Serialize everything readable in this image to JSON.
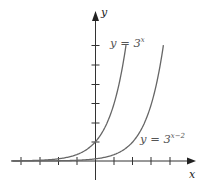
{
  "chart_data": {
    "type": "line",
    "title": "",
    "xlabel": "x",
    "ylabel": "y",
    "xlim": [
      -4,
      5
    ],
    "ylim": [
      -0.5,
      7
    ],
    "x_ticks": [
      -4,
      -3,
      -2,
      -1,
      1,
      2,
      3,
      4
    ],
    "y_ticks": [
      1,
      2,
      3,
      4,
      5,
      6
    ],
    "tick_labels_shown": false,
    "grid": false,
    "series": [
      {
        "name": "y = 3^x",
        "label_text": "y = 3",
        "label_superscript": "x",
        "x": [
          -4,
          -3,
          -2,
          -1,
          0,
          0.5,
          1,
          1.5,
          1.63
        ],
        "y": [
          0.012,
          0.037,
          0.111,
          0.333,
          1,
          1.732,
          3,
          5.196,
          6
        ]
      },
      {
        "name": "y = 3^(x-2)",
        "label_text": "y = 3",
        "label_superscript": "x−2",
        "x": [
          -2,
          -1,
          0,
          1,
          2,
          2.5,
          3,
          3.5,
          3.63
        ],
        "y": [
          0.012,
          0.037,
          0.111,
          0.333,
          1,
          1.732,
          3,
          5.196,
          6
        ]
      }
    ],
    "legend": "inline labels near curves"
  },
  "labels": {
    "x_axis": "x",
    "y_axis": "y",
    "curve1_base": "y = 3",
    "curve1_exp": "x",
    "curve2_base": "y = 3",
    "curve2_exp": "x−2"
  }
}
